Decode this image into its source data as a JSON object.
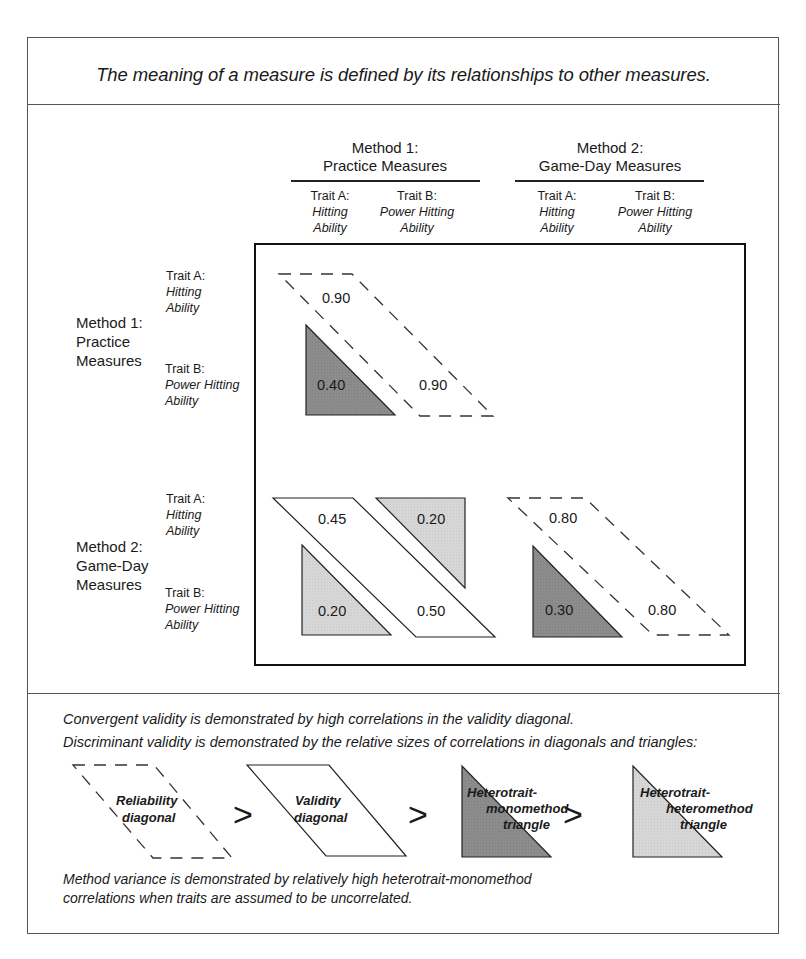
{
  "headline": "The meaning of a measure is defined by its relationships to other measures.",
  "columns": {
    "methods": [
      {
        "line1": "Method 1:",
        "line2": "Practice Measures"
      },
      {
        "line1": "Method 2:",
        "line2": "Game-Day Measures"
      }
    ],
    "traits": [
      {
        "label": "Trait A:",
        "name1": "Hitting",
        "name2": "Ability"
      },
      {
        "label": "Trait B:",
        "name1": "Power Hitting",
        "name2": "Ability"
      },
      {
        "label": "Trait A:",
        "name1": "Hitting",
        "name2": "Ability"
      },
      {
        "label": "Trait B:",
        "name1": "Power Hitting",
        "name2": "Ability"
      }
    ]
  },
  "rows": {
    "methods": [
      {
        "line1": "Method 1:",
        "line2": "Practice",
        "line3": "Measures"
      },
      {
        "line1": "Method 2:",
        "line2": "Game-Day",
        "line3": "Measures"
      }
    ],
    "traits": [
      {
        "label": "Trait A:",
        "name1": "Hitting",
        "name2": "Ability"
      },
      {
        "label": "Trait B:",
        "name1": "Power Hitting",
        "name2": "Ability"
      },
      {
        "label": "Trait A:",
        "name1": "Hitting",
        "name2": "Ability"
      },
      {
        "label": "Trait B:",
        "name1": "Power Hitting",
        "name2": "Ability"
      }
    ]
  },
  "matrix": {
    "m1_reliability_aa": "0.90",
    "m1_reliability_bb": "0.90",
    "m1_heterotrait_monomethod": "0.40",
    "validity_a": "0.45",
    "validity_b": "0.50",
    "heterotrait_heteromethod_upper": "0.20",
    "heterotrait_heteromethod_lower": "0.20",
    "m2_reliability_aa": "0.80",
    "m2_reliability_bb": "0.80",
    "m2_heterotrait_monomethod": "0.30"
  },
  "colors": {
    "dark_triangle": "#8c8c8c",
    "light_triangle": "#d6d6d6",
    "line": "#222222"
  },
  "notes": {
    "convergent": "Convergent validity is demonstrated by high correlations in the validity diagonal.",
    "discriminant": "Discriminant validity is demonstrated by the relative sizes of correlations in diagonals and triangles:",
    "method_variance_1": "Method variance is demonstrated by relatively high heterotrait-monomethod",
    "method_variance_2": "correlations when traits are assumed to be uncorrelated."
  },
  "legend": {
    "reliability_1": "Reliability",
    "reliability_2": "diagonal",
    "validity_1": "Validity",
    "validity_2": "diagonal",
    "htmm_1": "Heterotrait-",
    "htmm_2": "monomethod",
    "htmm_3": "triangle",
    "hthm_1": "Heterotrait-",
    "hthm_2": "heteromethod",
    "hthm_3": "triangle",
    "gt": ">"
  }
}
